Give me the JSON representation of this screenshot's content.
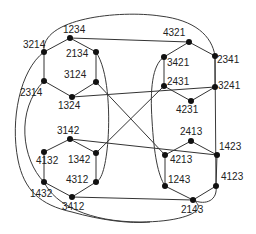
{
  "diagram": {
    "nodes": [
      {
        "id": "1234",
        "x": 70,
        "y": 38,
        "lx": 63,
        "ly": 33
      },
      {
        "id": "2134",
        "x": 96,
        "y": 52,
        "lx": 66,
        "ly": 57
      },
      {
        "id": "3124",
        "x": 96,
        "y": 82,
        "lx": 64,
        "ly": 78
      },
      {
        "id": "1324",
        "x": 72,
        "y": 97,
        "lx": 58,
        "ly": 109
      },
      {
        "id": "2314",
        "x": 44,
        "y": 81,
        "lx": 20,
        "ly": 96
      },
      {
        "id": "3214",
        "x": 44,
        "y": 52,
        "lx": 23,
        "ly": 48
      },
      {
        "id": "4321",
        "x": 189,
        "y": 42,
        "lx": 163,
        "ly": 36
      },
      {
        "id": "2341",
        "x": 215,
        "y": 56,
        "lx": 217,
        "ly": 63
      },
      {
        "id": "3241",
        "x": 215,
        "y": 87,
        "lx": 218,
        "ly": 89
      },
      {
        "id": "4231",
        "x": 191,
        "y": 101,
        "lx": 176,
        "ly": 113
      },
      {
        "id": "2431",
        "x": 164,
        "y": 86,
        "lx": 167,
        "ly": 85
      },
      {
        "id": "3421",
        "x": 164,
        "y": 57,
        "lx": 167,
        "ly": 66
      },
      {
        "id": "3142",
        "x": 70,
        "y": 139,
        "lx": 57,
        "ly": 134
      },
      {
        "id": "1342",
        "x": 96,
        "y": 153,
        "lx": 68,
        "ly": 163
      },
      {
        "id": "4312",
        "x": 96,
        "y": 182,
        "lx": 66,
        "ly": 183
      },
      {
        "id": "3412",
        "x": 72,
        "y": 197,
        "lx": 62,
        "ly": 210
      },
      {
        "id": "1432",
        "x": 44,
        "y": 182,
        "lx": 30,
        "ly": 197
      },
      {
        "id": "4132",
        "x": 44,
        "y": 152,
        "lx": 36,
        "ly": 164
      },
      {
        "id": "2413",
        "x": 191,
        "y": 141,
        "lx": 180,
        "ly": 135
      },
      {
        "id": "1423",
        "x": 217,
        "y": 155,
        "lx": 219,
        "ly": 150
      },
      {
        "id": "4123",
        "x": 216,
        "y": 186,
        "lx": 221,
        "ly": 180
      },
      {
        "id": "2143",
        "x": 193,
        "y": 200,
        "lx": 181,
        "ly": 213
      },
      {
        "id": "1243",
        "x": 165,
        "y": 186,
        "lx": 168,
        "ly": 183
      },
      {
        "id": "4213",
        "x": 165,
        "y": 155,
        "lx": 170,
        "ly": 163
      }
    ],
    "hexagons": [
      [
        "1234",
        "2134",
        "3124",
        "1324",
        "2314",
        "3214"
      ],
      [
        "4321",
        "2341",
        "3241",
        "4231",
        "2431",
        "3421"
      ],
      [
        "3142",
        "1342",
        "4312",
        "3412",
        "1432",
        "4132"
      ],
      [
        "2413",
        "1423",
        "4123",
        "2143",
        "1243",
        "4213"
      ]
    ],
    "straight_edges": [
      [
        "1234",
        "4321"
      ],
      [
        "3412",
        "2143"
      ],
      [
        "1324",
        "3241"
      ],
      [
        "3142",
        "1423"
      ]
    ],
    "colors": {
      "edge": "#333333",
      "node": "#111111",
      "text": "#222222",
      "background": "#ffffff"
    }
  }
}
